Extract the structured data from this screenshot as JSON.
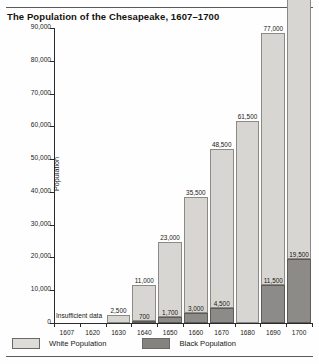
{
  "figure": {
    "title": "The Population of the Chesapeake, 1607–1700"
  },
  "annotations": {
    "insufficient_data": "Insufficient data"
  },
  "legend": {
    "items": [
      {
        "label": "White Population",
        "color": "#dedcd8",
        "key": "white"
      },
      {
        "label": "Black Population",
        "color": "#85837f",
        "key": "black"
      }
    ]
  },
  "chart_data": {
    "type": "bar",
    "title": "The Population of the Chesapeake, 1607–1700",
    "xlabel": "",
    "ylabel": "Population",
    "ylim": [
      0,
      90000
    ],
    "ytick_labels": [
      "0",
      "10,000",
      "20,000",
      "30,000",
      "40,000",
      "50,000",
      "60,000",
      "70,000",
      "80,000",
      "90,000"
    ],
    "ytick_values": [
      0,
      10000,
      20000,
      30000,
      40000,
      50000,
      60000,
      70000,
      80000,
      90000
    ],
    "grid": false,
    "legend_position": "bottom",
    "stacked": true,
    "categories": [
      "1607",
      "1620",
      "1630",
      "1640",
      "1650",
      "1660",
      "1670",
      "1680",
      "1690",
      "1700"
    ],
    "series": [
      {
        "name": "White Population",
        "color": "#d8d6d2",
        "values": [
          null,
          null,
          2500,
          11000,
          23000,
          35500,
          48500,
          61500,
          77000,
          87500
        ],
        "labels": [
          "",
          "",
          "2,500",
          "11,000",
          "23,000",
          "35,500",
          "48,500",
          "61,500",
          "77,000",
          "87,500"
        ]
      },
      {
        "name": "Black Population",
        "color": "#8d8b87",
        "values": [
          null,
          null,
          null,
          700,
          1700,
          3000,
          4500,
          null,
          11500,
          19500
        ],
        "labels": [
          "",
          "",
          "",
          "700",
          "1,700",
          "3,000",
          "4,500",
          "",
          "11,500",
          "19,500"
        ]
      }
    ],
    "notes": [
      {
        "text": "Insufficient data",
        "applies_to": [
          "1607",
          "1620"
        ]
      }
    ]
  }
}
